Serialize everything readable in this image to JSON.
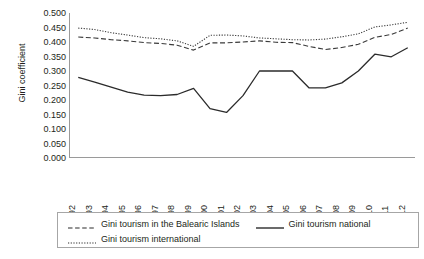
{
  "chart_data": {
    "type": "line",
    "title": "",
    "xlabel": "",
    "ylabel": "Gini coefficient",
    "ylim": [
      0.0,
      0.5
    ],
    "ytick_step": 0.05,
    "grid": false,
    "legend_position": "bottom",
    "x": [
      "1992",
      "1993",
      "1994",
      "1995",
      "1996",
      "1997",
      "1998",
      "1999",
      "2000",
      "2001",
      "2002",
      "2003",
      "2004",
      "2005",
      "2006",
      "2007",
      "2008",
      "2009",
      "2010",
      "2011",
      "2012"
    ],
    "categories": [
      "1992",
      "1993",
      "1994",
      "1995",
      "1996",
      "1997",
      "1998",
      "1999",
      "2000",
      "2001",
      "2002",
      "2003",
      "2004",
      "2005",
      "2006",
      "2007",
      "2008",
      "2009",
      "2010",
      "2011",
      "2012"
    ],
    "ytick_labels": [
      "0.500",
      "0.450",
      "0.400",
      "0.350",
      "0.300",
      "0.250",
      "0.200",
      "0.150",
      "0.100",
      "0.050",
      "0.000"
    ],
    "ytick_values": [
      0.5,
      0.45,
      0.4,
      0.35,
      0.3,
      0.25,
      0.2,
      0.15,
      0.1,
      0.05,
      0.0
    ],
    "series": [
      {
        "name": "Gini tourism in the Balearic Islands",
        "style": "dashed",
        "color": "#3a3a3a",
        "values": [
          0.417,
          0.414,
          0.408,
          0.404,
          0.398,
          0.395,
          0.389,
          0.372,
          0.397,
          0.397,
          0.4,
          0.404,
          0.399,
          0.398,
          0.385,
          0.374,
          0.381,
          0.392,
          0.416,
          0.426,
          0.448
        ]
      },
      {
        "name": "Gini tourism national",
        "style": "solid",
        "color": "#2b2b2b",
        "values": [
          0.278,
          0.262,
          0.244,
          0.227,
          0.217,
          0.215,
          0.219,
          0.214,
          0.223,
          0.216,
          0.231,
          0.21,
          0.197,
          0.203,
          0.214,
          0.221,
          0.233,
          0.258,
          0.275,
          0.287,
          0.3
        ]
      },
      {
        "name": "Gini tourism international",
        "style": "dotted",
        "color": "#3a3a3a",
        "values": [
          0.448,
          0.443,
          0.432,
          0.424,
          0.415,
          0.411,
          0.404,
          0.385,
          0.423,
          0.424,
          0.421,
          0.414,
          0.411,
          0.408,
          0.407,
          0.41,
          0.418,
          0.428,
          0.452,
          0.459,
          0.468
        ]
      }
    ],
    "series_plot_values": {
      "Gini tourism in the Balearic Islands": [
        0.417,
        0.414,
        0.408,
        0.404,
        0.398,
        0.395,
        0.389,
        0.372,
        0.397,
        0.397,
        0.4,
        0.404,
        0.399,
        0.398,
        0.385,
        0.374,
        0.381,
        0.392,
        0.416,
        0.426,
        0.448
      ],
      "Gini tourism national": [
        0.278,
        0.262,
        0.244,
        0.227,
        0.217,
        0.215,
        0.219,
        0.214,
        0.223,
        0.216,
        0.231,
        0.21,
        0.197,
        0.203,
        0.214,
        0.221,
        0.233,
        0.258,
        0.275,
        0.287,
        0.3
      ],
      "Gini tourism international": [
        0.448,
        0.443,
        0.432,
        0.424,
        0.415,
        0.411,
        0.404,
        0.385,
        0.423,
        0.424,
        0.421,
        0.414,
        0.411,
        0.408,
        0.407,
        0.41,
        0.418,
        0.428,
        0.452,
        0.459,
        0.468
      ]
    },
    "national_values_actual": [
      0.278,
      0.262,
      0.244,
      0.227,
      0.217,
      0.215,
      0.219,
      0.24,
      0.17,
      0.157,
      0.215,
      0.3,
      0.3,
      0.3,
      0.242,
      0.242,
      0.259,
      0.3,
      0.358,
      0.349,
      0.38
    ]
  },
  "legend": {
    "items": [
      {
        "label": "Gini tourism in the Balearic Islands",
        "style": "dashed"
      },
      {
        "label": "Gini tourism national",
        "style": "solid"
      },
      {
        "label": "Gini tourism international",
        "style": "dotted"
      }
    ]
  },
  "axis": {
    "y_title": "Gini coefficient"
  }
}
